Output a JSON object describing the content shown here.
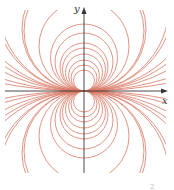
{
  "figure": {
    "type": "family of circles tangent at origin (dipole-like field)",
    "axes": {
      "x_label": "x",
      "y_label": "y",
      "color": "#333333"
    },
    "curve_color": "#d97a66",
    "origin_px": [
      84,
      91
    ],
    "clip_box_px": [
      5,
      10,
      166,
      173
    ],
    "vertical_family_radii_px": [
      10.5,
      13,
      15.5,
      18.5,
      21.5,
      24,
      29,
      33.5,
      45,
      62,
      90,
      140
    ],
    "horizontal_family_radii_px": [
      60,
      85,
      120,
      180,
      280,
      450
    ],
    "corner_mark": "2"
  }
}
